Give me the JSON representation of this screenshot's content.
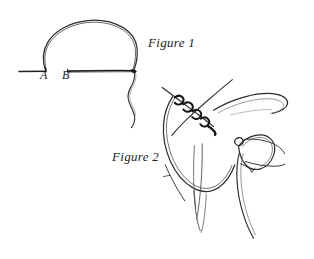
{
  "canvas": {
    "width": 314,
    "height": 259,
    "background_color": "#ffffff",
    "ink_color": "#2b2b2b",
    "ink_color_light": "#5a5a5a",
    "ink_color_dark": "#111111",
    "medium": "hand-drawn-pen-sketch"
  },
  "labels": {
    "figure_1": "Figure 1",
    "figure_2": "Figure 2",
    "point_a": "A",
    "point_b": "B"
  },
  "figure_1": {
    "caption": "Figure 1",
    "description": "A loop of suture thread arches above a horizontal tissue line; the left foot of the arch meets the line at point A and a second horizontal segment begins at point B and runs right to the arch's right foot, where a wavy thread tail hangs down.",
    "elements": [
      "horizontal-line-left",
      "arch-loop",
      "horizontal-line-right",
      "hanging-thread-tail",
      "point-a-marker",
      "point-b-marker"
    ]
  },
  "figure_2": {
    "caption": "Figure 2",
    "description": "A suture loop is being tied: two thread strands cross and twist into a double wrap at upper left, a long curved loop of thread sweeps down and around, a needle curves away at upper right, and a needle-holder instrument grips the thread at right.",
    "elements": [
      "crossing-strand-upper-left",
      "crossing-strand-upper-right",
      "twisted-double-wrap",
      "large-thread-loop",
      "curved-needle",
      "needle-holder-instrument",
      "trailing-thread-tails"
    ]
  }
}
